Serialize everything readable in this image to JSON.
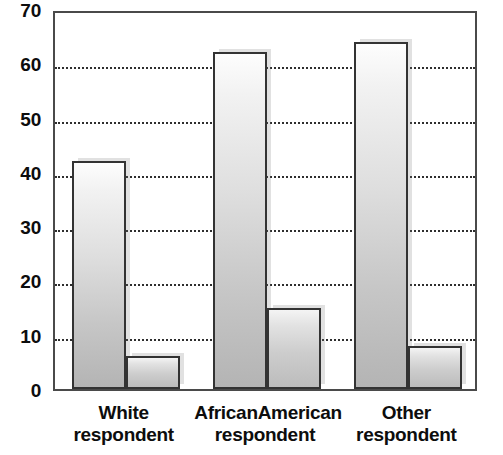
{
  "chart_data": {
    "type": "bar",
    "title": "",
    "subtitle": "",
    "xlabel": "",
    "ylabel": "",
    "categories": [
      "White respondent",
      "AfricanAmerican respondent",
      "Other respondent"
    ],
    "category_lines": [
      [
        "White",
        "respondent"
      ],
      [
        "AfricanAmerican",
        "respondent"
      ],
      [
        "Other",
        "respondent"
      ]
    ],
    "series": [
      {
        "name": "Series 1",
        "values": [
          42,
          62,
          64
        ]
      },
      {
        "name": "Series 2",
        "values": [
          6,
          15,
          8
        ]
      }
    ],
    "ylim": [
      0,
      70
    ],
    "ytick_values": [
      70,
      60,
      50,
      40,
      30,
      20,
      10,
      0
    ],
    "ytick_labels": [
      "70",
      "60",
      "50",
      "40",
      "30",
      "20",
      "10",
      "0"
    ],
    "gridline_values": [
      60,
      50,
      40,
      30,
      20,
      10
    ],
    "grid": true,
    "grid_style": "dotted",
    "grid_axis": "y",
    "legend": false,
    "legend_position": "none",
    "annotations": [],
    "colors": {
      "bar_fill_top": "#fdfdfd",
      "bar_fill_bottom": "#b4b4b4",
      "bar_outline": "#333333",
      "gridline": "#2e2e2e",
      "axis": "#4a4a4a",
      "text": "#0d0d0d",
      "background": "#ffffff"
    }
  }
}
